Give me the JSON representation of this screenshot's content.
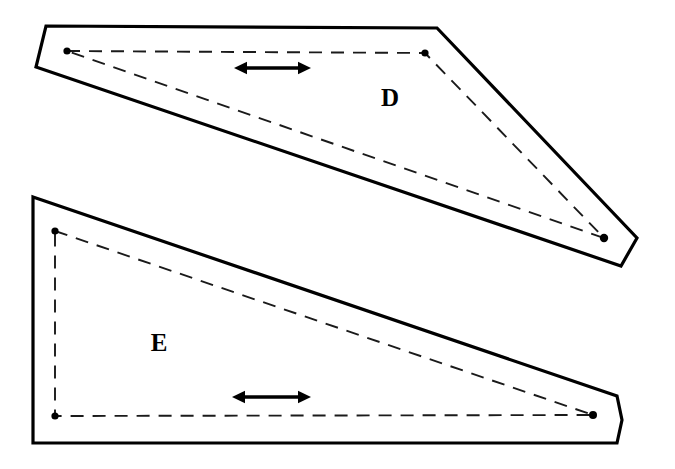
{
  "figure": {
    "title": "",
    "background_color": "#ffffff",
    "stroke_color": "#000000",
    "dashed_color": "#1a1a1a",
    "width": 675,
    "height": 469
  },
  "shapes": [
    {
      "id": "D",
      "label": "D",
      "label_position": {
        "x": 390,
        "y": 100
      },
      "outline_points": "46,26 437,28 637,238 621,266 36,67",
      "dashed_triangle_points": "67,51 425,53 604,238 67,51",
      "vertices": [
        {
          "name": "top-left-node",
          "x": 67,
          "y": 51
        },
        {
          "name": "top-right-node",
          "x": 425,
          "y": 53
        },
        {
          "name": "apex-node",
          "x": 604,
          "y": 238
        }
      ],
      "arrow": {
        "x1": 234,
        "x2": 311,
        "y": 68,
        "label": ""
      }
    },
    {
      "id": "E",
      "label": "E",
      "label_position": {
        "x": 159,
        "y": 345
      },
      "outline_points": "33,197 617,396 622,420 617,443 33,443",
      "dashed_triangle_points": "55,231 593,415 55,416 55,231",
      "vertices": [
        {
          "name": "top-left-node",
          "x": 55,
          "y": 231
        },
        {
          "name": "bottom-left-node",
          "x": 55,
          "y": 416
        },
        {
          "name": "right-node",
          "x": 593,
          "y": 415
        }
      ],
      "arrow": {
        "x1": 232,
        "x2": 311,
        "y": 397,
        "label": ""
      }
    }
  ]
}
